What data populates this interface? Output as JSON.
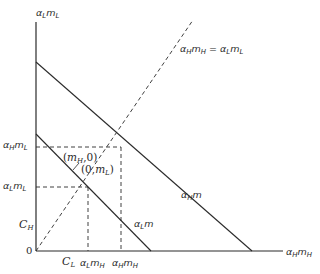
{
  "diagram": {
    "type": "economics-budget-lines",
    "axes": {
      "y_label": {
        "base1": "α",
        "sub1": "L",
        "base2": "m",
        "sub2": "L"
      },
      "x_label": {
        "base1": "α",
        "sub1": "H",
        "base2": "m",
        "sub2": "H"
      },
      "origin": "0"
    },
    "lines": {
      "outer_budget": {
        "label_base": "α",
        "label_sub": "H",
        "label_tail": "m"
      },
      "inner_budget": {
        "label_base": "α",
        "label_sub": "L",
        "label_tail": "m"
      },
      "diagonal": {
        "label": "αHmH = αLmL",
        "style": "dashed"
      }
    },
    "y_ticks": {
      "aHmL": {
        "base1": "α",
        "sub1": "H",
        "base2": "m",
        "sub2": "L"
      },
      "aLmL": {
        "base1": "α",
        "sub1": "L",
        "base2": "m",
        "sub2": "L"
      },
      "CH": {
        "base": "C",
        "sub": "H"
      }
    },
    "x_ticks": {
      "CL": {
        "base": "C",
        "sub": "L"
      },
      "aLmH": {
        "base1": "α",
        "sub1": "L",
        "base2": "m",
        "sub2": "H"
      },
      "aHmH": {
        "base1": "α",
        "sub1": "H",
        "base2": "m",
        "sub2": "H"
      }
    },
    "point_labels": {
      "mH0": {
        "open": "(",
        "m": "m",
        "sub": "H",
        "close": ",0)"
      },
      "0mL": {
        "open": "(0,",
        "m": "m",
        "sub": "L",
        "close": ")"
      }
    },
    "colors": {
      "line": "#2a2a2a",
      "background": "#ffffff"
    }
  }
}
